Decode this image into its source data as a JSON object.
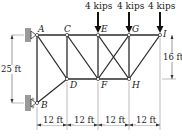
{
  "figure": {
    "type": "truss-diagram",
    "nodes": {
      "A": "A",
      "B": "B",
      "C": "C",
      "D": "D",
      "E": "E",
      "F": "F",
      "G": "G",
      "H": "H",
      "I": "I"
    },
    "loads": [
      {
        "node": "E",
        "label": "4 kips"
      },
      {
        "node": "G",
        "label": "4 kips"
      },
      {
        "node": "I",
        "label": "4 kips"
      }
    ],
    "dimensions": {
      "horizontal": [
        "12 ft",
        "12 ft",
        "12 ft",
        "12 ft"
      ],
      "left_vertical": "25 ft",
      "right_vertical": "16 ft"
    },
    "colors": {
      "member": "#2a2a2a",
      "support": "#9a9a9a",
      "dimension": "#555555"
    }
  }
}
